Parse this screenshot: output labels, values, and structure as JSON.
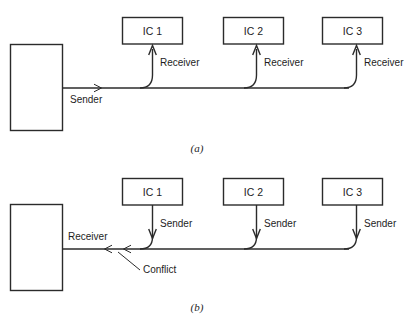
{
  "figure": {
    "background_color": "#ffffff",
    "line_color": "#2b2b2b",
    "text_color": "#1d1d1d",
    "panels": [
      {
        "id": "a",
        "caption": "(a)",
        "controller_box_label": "",
        "bus_line_label": "Sender",
        "ics": [
          {
            "label": "IC 1",
            "line_label": "Receiver"
          },
          {
            "label": "IC 2",
            "line_label": "Receiver"
          },
          {
            "label": "IC 3",
            "line_label": "Receiver"
          }
        ]
      },
      {
        "id": "b",
        "caption": "(b)",
        "controller_box_label": "",
        "bus_line_label": "Receiver",
        "annotation_label": "Conflict",
        "ics": [
          {
            "label": "IC 1",
            "line_label": "Sender"
          },
          {
            "label": "IC 2",
            "line_label": "Sender"
          },
          {
            "label": "IC 3",
            "line_label": "Sender"
          }
        ]
      }
    ]
  }
}
